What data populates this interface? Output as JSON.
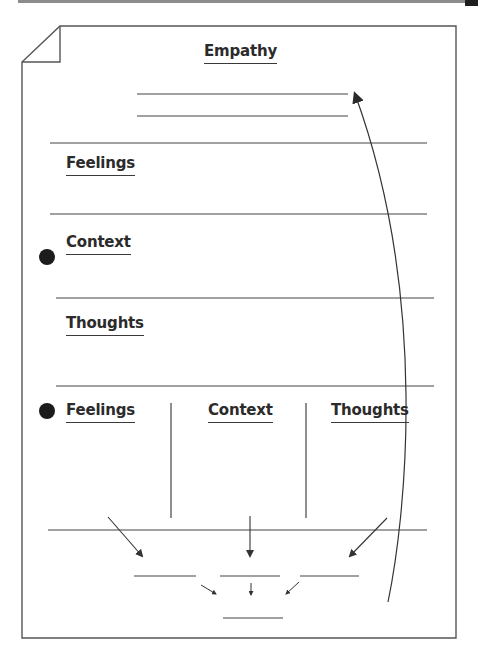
{
  "worksheet": {
    "title": "Empathy",
    "sections": [
      {
        "label": "Feelings"
      },
      {
        "label": "Context",
        "bulleted": true
      },
      {
        "label": "Thoughts"
      }
    ],
    "columns": [
      {
        "label": "Feelings",
        "bulleted": true
      },
      {
        "label": "Context"
      },
      {
        "label": "Thoughts"
      }
    ]
  },
  "colors": {
    "line": "#3a3a3a",
    "text": "#2b2b2b",
    "bullet": "#1c1c1c",
    "page_border": "#555555",
    "top_bar": "#8c8c8c"
  }
}
